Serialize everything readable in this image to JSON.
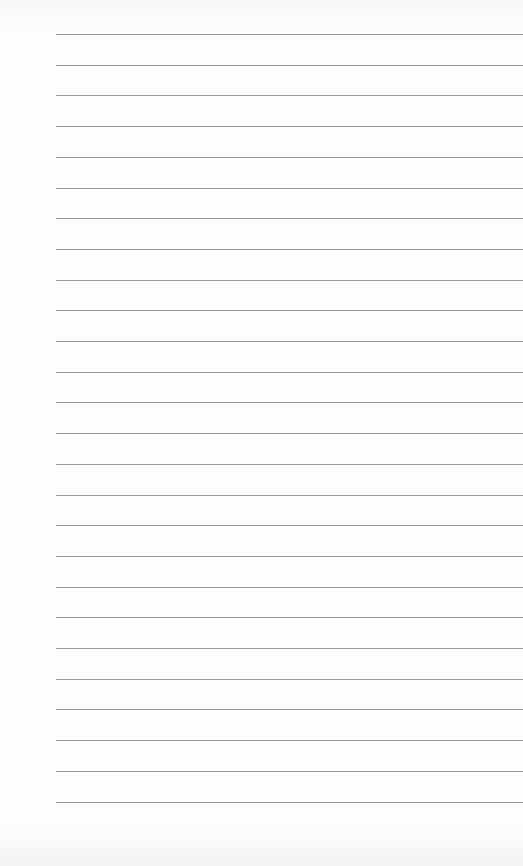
{
  "page": {
    "type": "lined-paper",
    "line_color": "#9a9a9a",
    "background_color": "#fdfdfd",
    "line_count": 26,
    "first_line_y": 34,
    "line_spacing": 30.7,
    "line_left": 56
  }
}
